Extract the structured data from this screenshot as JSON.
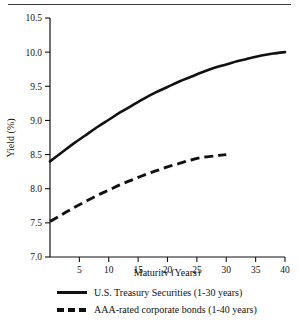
{
  "chart_data": {
    "type": "line",
    "title": "",
    "xlabel": "Maturity (Years)",
    "ylabel": "Yield (%)",
    "xlim": [
      0,
      40
    ],
    "ylim": [
      7.0,
      10.5
    ],
    "grid": false,
    "legend_position": "bottom",
    "xticks": [
      5,
      10,
      15,
      20,
      25,
      30,
      35,
      40
    ],
    "xtick_labels": [
      "5",
      "10",
      "15",
      "20",
      "25",
      "30",
      "35",
      "40"
    ],
    "yticks": [
      7.0,
      7.5,
      8.0,
      8.5,
      9.0,
      9.5,
      10.0,
      10.5
    ],
    "ytick_labels": [
      "7.0",
      "7.5",
      "8.0",
      "8.5",
      "9.0",
      "9.5",
      "10.0",
      "10.5"
    ],
    "series": [
      {
        "name": "U.S. Treasury Securities (1-30 years)",
        "style": "solid",
        "color": "#111111",
        "x": [
          0,
          2,
          4,
          6,
          8,
          10,
          12,
          14,
          16,
          18,
          20,
          22,
          24,
          26,
          28,
          30,
          32,
          34,
          36,
          38,
          40
        ],
        "values": [
          8.4,
          8.53,
          8.66,
          8.78,
          8.9,
          9.01,
          9.12,
          9.22,
          9.32,
          9.41,
          9.49,
          9.57,
          9.64,
          9.71,
          9.77,
          9.82,
          9.87,
          9.91,
          9.95,
          9.98,
          10.0
        ]
      },
      {
        "name": "AAA-rated corporate bonds (1-40 years)",
        "style": "dashed",
        "color": "#111111",
        "x": [
          0,
          2,
          4,
          6,
          8,
          10,
          12,
          14,
          16,
          18,
          20,
          22,
          24,
          26,
          28,
          30
        ],
        "values": [
          7.52,
          7.62,
          7.72,
          7.81,
          7.9,
          7.98,
          8.06,
          8.13,
          8.2,
          8.26,
          8.32,
          8.37,
          8.42,
          8.46,
          8.48,
          8.5
        ]
      }
    ],
    "legend": [
      "U.S. Treasury Securities (1-30 years)",
      "AAA-rated corporate bonds (1-40 years)"
    ]
  },
  "figure": {
    "top_rule": true
  }
}
